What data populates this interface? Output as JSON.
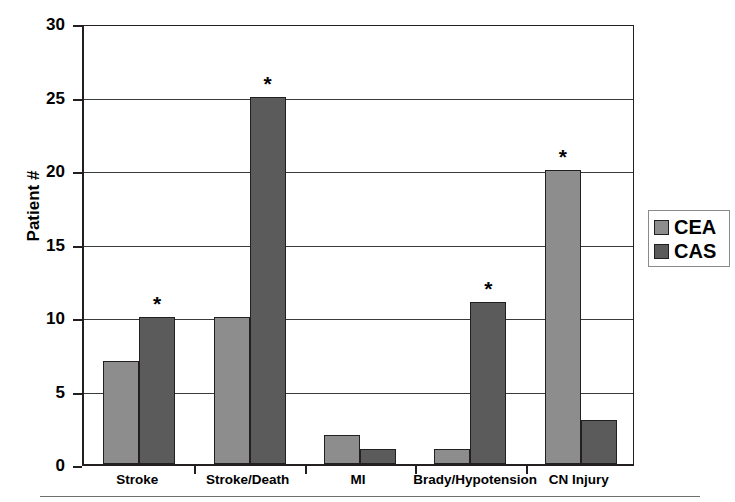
{
  "chart_data": {
    "type": "bar",
    "title": "",
    "xlabel": "",
    "ylabel": "Patient #",
    "ylim": [
      0,
      30
    ],
    "ytick_values": [
      0,
      5,
      10,
      15,
      20,
      25,
      30
    ],
    "ytick_labels": [
      "0",
      "5",
      "10",
      "15",
      "20",
      "25",
      "30"
    ],
    "grid": true,
    "grid_axis": "y",
    "legend_position": "right",
    "categories": [
      "Stroke",
      "Stroke/Death",
      "MI",
      "Brady/Hypotension",
      "CN Injury"
    ],
    "series": [
      {
        "name": "CEA",
        "color": "#8d8d8d",
        "values": [
          7,
          10,
          2,
          1,
          20
        ],
        "significance_markers": [
          false,
          false,
          false,
          false,
          true
        ]
      },
      {
        "name": "CAS",
        "color": "#5b5b5b",
        "values": [
          10,
          25,
          1,
          11,
          3
        ],
        "significance_markers": [
          true,
          true,
          false,
          true,
          false
        ]
      }
    ],
    "annotation_symbol": "*",
    "annotations": [
      {
        "category": "Stroke",
        "series": "CAS",
        "value": 10,
        "symbol": "*"
      },
      {
        "category": "Stroke/Death",
        "series": "CAS",
        "value": 25,
        "symbol": "*"
      },
      {
        "category": "Brady/Hypotension",
        "series": "CAS",
        "value": 11,
        "symbol": "*"
      },
      {
        "category": "CN Injury",
        "series": "CEA",
        "value": 20,
        "symbol": "*"
      }
    ]
  },
  "legend": {
    "entries": [
      {
        "label": "CEA",
        "color": "#8d8d8d"
      },
      {
        "label": "CAS",
        "color": "#5b5b5b"
      }
    ]
  },
  "axis": {
    "y_title": "Patient #"
  },
  "colors": {
    "cea": "#8d8d8d",
    "cas": "#5b5b5b",
    "axis": "#231f20",
    "grid": "#3a3a3a",
    "background": "#ffffff"
  }
}
